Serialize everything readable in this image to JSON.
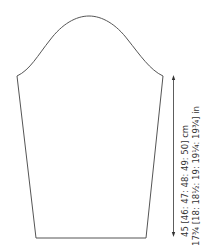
{
  "diagram": {
    "type": "sleeve-schematic",
    "measurement": {
      "cm": "45 [46: 47: 48: 49: 50] cm",
      "in": "17¾ [18: 18½: 19: 19¼: 19¾] in"
    },
    "colors": {
      "outline": "#555555",
      "text": "#333333"
    }
  }
}
